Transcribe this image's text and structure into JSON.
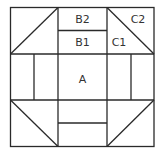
{
  "diagram": {
    "type": "quilt-block",
    "labels": {
      "a": "A",
      "b1": "B1",
      "b2": "B2",
      "c1": "C1",
      "c2": "C2"
    },
    "colors": {
      "line": "#2a2a2a",
      "text": "#333333",
      "background": "#ffffff"
    }
  }
}
